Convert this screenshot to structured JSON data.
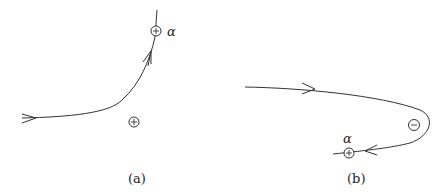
{
  "panels": [
    {
      "id": "a",
      "caption": "(a)",
      "caption_letter": "a",
      "charges": [
        {
          "sign": "+",
          "label": "α",
          "position": "on-trajectory"
        },
        {
          "sign": "+",
          "label": "",
          "position": "below-curve"
        }
      ]
    },
    {
      "id": "b",
      "caption": "(b)",
      "caption_letter": "b",
      "charges": [
        {
          "sign": "−",
          "label": "",
          "position": "inside-turn"
        },
        {
          "sign": "+",
          "label": "α",
          "position": "on-trajectory"
        }
      ]
    }
  ],
  "symbols": {
    "alpha": "α",
    "plus": "+",
    "minus": "−"
  }
}
